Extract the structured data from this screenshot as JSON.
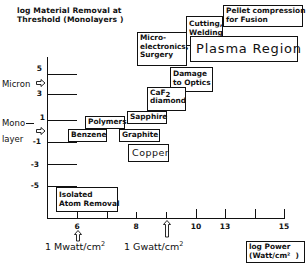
{
  "title": "log Material Removal at\nThreshold (Monolayers )",
  "y_axis": {
    "ticks": [
      "5",
      "3",
      "1",
      "-1",
      "-3",
      "-5"
    ],
    "side_labels": {
      "micron": "Micron",
      "monolayer_line1": "Mono",
      "monolayer_line2": "layer"
    }
  },
  "x_axis": {
    "tick_labels": [
      "6",
      "8",
      "10",
      "13",
      "15"
    ],
    "unit_labels": {
      "mwatt": "1 Mwatt/cm",
      "gwatt": "1 Gwatt/cm",
      "sup": "2"
    },
    "axis_title": "log Power\n(Watt/cm²  )"
  },
  "boxes": {
    "pellet": "Pellet compression\nfor Fusion",
    "cutting": "Cutting,\nWelding",
    "micro": "Micro-\nelectronics,\nSurgery",
    "plasma": "Plasma Region",
    "damage": "Damage\nto Optics",
    "caf2_main": "CaF",
    "caf2_sub": "2",
    "caf2_line2": "diamond",
    "sapphire": "Sapphire",
    "polymers": "Polymers",
    "benzene": "Benzene",
    "graphite": "Graphite",
    "copper": "Copper",
    "isolated": "Isolated\nAtom Removal"
  }
}
